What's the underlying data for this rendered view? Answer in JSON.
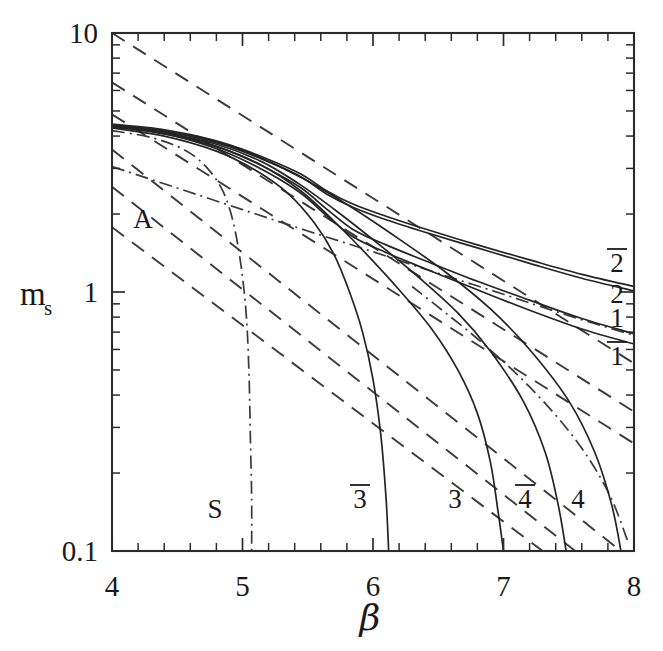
{
  "figure": {
    "title": "",
    "background": "#ffffff",
    "ink_color": "#1a1a1a"
  },
  "axes": {
    "x": {
      "label": "β",
      "scale": "linear",
      "min": 4,
      "max": 8,
      "major_ticks": [
        4,
        5,
        6,
        7,
        8
      ],
      "tick_labels": [
        "4",
        "5",
        "6",
        "7",
        "8"
      ],
      "minor_step": 0.2
    },
    "y": {
      "label_base": "m",
      "label_sub": "s",
      "scale": "log",
      "min": 0.1,
      "max": 10,
      "major_ticks": [
        0.1,
        1,
        10
      ],
      "tick_labels": [
        "0.1",
        "1",
        "10"
      ]
    }
  },
  "curve_labels": [
    {
      "name": "label-2-bar",
      "text": "2",
      "overbar": true,
      "x_px": 617,
      "y_px": 272
    },
    {
      "name": "label-2",
      "text": "2",
      "overbar": false,
      "x_px": 617,
      "y_px": 303
    },
    {
      "name": "label-1",
      "text": "1",
      "overbar": false,
      "x_px": 617,
      "y_px": 327
    },
    {
      "name": "label-1-bar",
      "text": "1",
      "overbar": true,
      "x_px": 617,
      "y_px": 365
    },
    {
      "name": "label-3-bar",
      "text": "3",
      "overbar": true,
      "x_px": 360,
      "y_px": 508
    },
    {
      "name": "label-3",
      "text": "3",
      "overbar": false,
      "x_px": 455,
      "y_px": 508
    },
    {
      "name": "label-4-bar",
      "text": "4",
      "overbar": true,
      "x_px": 525,
      "y_px": 508
    },
    {
      "name": "label-4",
      "text": "4",
      "overbar": false,
      "x_px": 578,
      "y_px": 508
    },
    {
      "name": "label-A",
      "text": "A",
      "overbar": false,
      "x_px": 143,
      "y_px": 228
    },
    {
      "name": "label-S",
      "text": "S",
      "overbar": false,
      "x_px": 215,
      "y_px": 518
    }
  ],
  "chart_data": {
    "type": "line",
    "title": "",
    "xlabel": "β",
    "ylabel": "m_s",
    "xscale": "linear",
    "yscale": "log",
    "xlim": [
      4,
      8
    ],
    "ylim": [
      0.1,
      10
    ],
    "grid": false,
    "legend": "inline curve end-labels",
    "series": [
      {
        "name": "2bar",
        "label": "2̄",
        "style": "solid",
        "points": [
          [
            4.0,
            4.45
          ],
          [
            4.3,
            4.3
          ],
          [
            4.6,
            4.05
          ],
          [
            4.9,
            3.7
          ],
          [
            5.2,
            3.25
          ],
          [
            5.45,
            2.85
          ],
          [
            5.65,
            2.45
          ],
          [
            5.85,
            2.18
          ],
          [
            6.1,
            1.96
          ],
          [
            6.4,
            1.75
          ],
          [
            6.8,
            1.52
          ],
          [
            7.2,
            1.33
          ],
          [
            7.6,
            1.17
          ],
          [
            8.0,
            1.05
          ]
        ]
      },
      {
        "name": "2",
        "label": "2",
        "style": "solid",
        "points": [
          [
            4.0,
            4.42
          ],
          [
            4.3,
            4.26
          ],
          [
            4.6,
            4.0
          ],
          [
            4.9,
            3.64
          ],
          [
            5.2,
            3.18
          ],
          [
            5.45,
            2.78
          ],
          [
            5.65,
            2.38
          ],
          [
            5.85,
            2.12
          ],
          [
            6.1,
            1.9
          ],
          [
            6.4,
            1.7
          ],
          [
            6.8,
            1.48
          ],
          [
            7.2,
            1.29
          ],
          [
            7.6,
            1.13
          ],
          [
            8.0,
            1.01
          ]
        ]
      },
      {
        "name": "1",
        "label": "1",
        "style": "solid",
        "points": [
          [
            4.0,
            4.4
          ],
          [
            4.3,
            4.22
          ],
          [
            4.6,
            3.92
          ],
          [
            4.9,
            3.5
          ],
          [
            5.2,
            2.98
          ],
          [
            5.45,
            2.52
          ],
          [
            5.65,
            2.08
          ],
          [
            5.85,
            1.74
          ],
          [
            6.1,
            1.52
          ],
          [
            6.4,
            1.32
          ],
          [
            6.8,
            1.1
          ],
          [
            7.2,
            0.93
          ],
          [
            7.6,
            0.79
          ],
          [
            8.0,
            0.69
          ]
        ]
      },
      {
        "name": "1bar",
        "label": "1̄",
        "style": "solid",
        "points": [
          [
            4.0,
            4.38
          ],
          [
            4.3,
            4.18
          ],
          [
            4.6,
            3.86
          ],
          [
            4.9,
            3.42
          ],
          [
            5.2,
            2.88
          ],
          [
            5.45,
            2.4
          ],
          [
            5.65,
            1.96
          ],
          [
            5.85,
            1.63
          ],
          [
            6.1,
            1.42
          ],
          [
            6.4,
            1.23
          ],
          [
            6.8,
            1.02
          ],
          [
            7.2,
            0.85
          ],
          [
            7.6,
            0.72
          ],
          [
            8.0,
            0.63
          ]
        ]
      },
      {
        "name": "3bar",
        "label": "3̄",
        "style": "solid",
        "points": [
          [
            4.0,
            4.3
          ],
          [
            4.4,
            4.0
          ],
          [
            4.8,
            3.5
          ],
          [
            5.1,
            2.95
          ],
          [
            5.35,
            2.4
          ],
          [
            5.55,
            1.85
          ],
          [
            5.7,
            1.4
          ],
          [
            5.82,
            1.0
          ],
          [
            5.92,
            0.7
          ],
          [
            6.0,
            0.46
          ],
          [
            6.06,
            0.28
          ],
          [
            6.1,
            0.16
          ],
          [
            6.12,
            0.1
          ]
        ]
      },
      {
        "name": "3",
        "label": "3",
        "style": "solid",
        "points": [
          [
            4.0,
            4.34
          ],
          [
            4.4,
            4.08
          ],
          [
            4.8,
            3.64
          ],
          [
            5.15,
            3.08
          ],
          [
            5.45,
            2.45
          ],
          [
            5.7,
            1.88
          ],
          [
            5.95,
            1.4
          ],
          [
            6.2,
            1.02
          ],
          [
            6.45,
            0.72
          ],
          [
            6.65,
            0.5
          ],
          [
            6.8,
            0.34
          ],
          [
            6.9,
            0.22
          ],
          [
            6.96,
            0.14
          ],
          [
            7.0,
            0.1
          ]
        ]
      },
      {
        "name": "4bar",
        "label": "4̄",
        "style": "solid",
        "points": [
          [
            4.0,
            4.36
          ],
          [
            4.4,
            4.12
          ],
          [
            4.8,
            3.72
          ],
          [
            5.15,
            3.18
          ],
          [
            5.45,
            2.58
          ],
          [
            5.75,
            2.0
          ],
          [
            6.05,
            1.52
          ],
          [
            6.35,
            1.14
          ],
          [
            6.65,
            0.83
          ],
          [
            6.9,
            0.59
          ],
          [
            7.15,
            0.38
          ],
          [
            7.32,
            0.24
          ],
          [
            7.42,
            0.15
          ],
          [
            7.48,
            0.1
          ]
        ]
      },
      {
        "name": "4",
        "label": "4",
        "style": "solid",
        "points": [
          [
            4.0,
            4.38
          ],
          [
            4.4,
            4.16
          ],
          [
            4.8,
            3.8
          ],
          [
            5.15,
            3.28
          ],
          [
            5.5,
            2.68
          ],
          [
            5.85,
            2.1
          ],
          [
            6.2,
            1.6
          ],
          [
            6.55,
            1.2
          ],
          [
            6.9,
            0.86
          ],
          [
            7.2,
            0.6
          ],
          [
            7.5,
            0.38
          ],
          [
            7.7,
            0.24
          ],
          [
            7.83,
            0.15
          ],
          [
            7.9,
            0.1
          ]
        ]
      }
    ],
    "reference_lines_dashed": [
      {
        "name": "dash-1",
        "points": [
          [
            4.0,
            10.0
          ],
          [
            8.0,
            0.53
          ]
        ]
      },
      {
        "name": "dash-2",
        "points": [
          [
            4.0,
            6.45
          ],
          [
            8.0,
            0.345
          ]
        ]
      },
      {
        "name": "dash-3",
        "points": [
          [
            4.0,
            4.85
          ],
          [
            8.0,
            0.26
          ]
        ]
      },
      {
        "name": "dash-4",
        "points": [
          [
            4.0,
            3.55
          ],
          [
            7.9,
            0.1
          ]
        ]
      },
      {
        "name": "dash-5",
        "points": [
          [
            4.0,
            2.55
          ],
          [
            7.55,
            0.1
          ]
        ]
      },
      {
        "name": "dash-6",
        "points": [
          [
            4.0,
            1.78
          ],
          [
            7.3,
            0.1
          ]
        ]
      }
    ],
    "reference_lines_dashdot": [
      {
        "name": "curve-A",
        "points": [
          [
            4.0,
            3.05
          ],
          [
            4.5,
            2.52
          ],
          [
            5.0,
            2.08
          ],
          [
            5.5,
            1.72
          ],
          [
            6.0,
            1.43
          ],
          [
            6.5,
            1.18
          ],
          [
            7.0,
            0.98
          ],
          [
            7.5,
            0.81
          ],
          [
            8.0,
            0.68
          ]
        ]
      },
      {
        "name": "curve-S",
        "points": [
          [
            4.0,
            4.2
          ],
          [
            4.3,
            3.95
          ],
          [
            4.55,
            3.55
          ],
          [
            4.72,
            3.05
          ],
          [
            4.85,
            2.45
          ],
          [
            4.93,
            1.85
          ],
          [
            4.99,
            1.25
          ],
          [
            5.03,
            0.8
          ],
          [
            5.05,
            0.48
          ],
          [
            5.06,
            0.28
          ],
          [
            5.07,
            0.16
          ],
          [
            5.07,
            0.1
          ]
        ]
      },
      {
        "name": "dashdot-lower",
        "points": [
          [
            6.3,
            1.05
          ],
          [
            6.8,
            0.66
          ],
          [
            7.2,
            0.43
          ],
          [
            7.55,
            0.27
          ],
          [
            7.8,
            0.17
          ],
          [
            7.95,
            0.11
          ]
        ]
      }
    ]
  }
}
